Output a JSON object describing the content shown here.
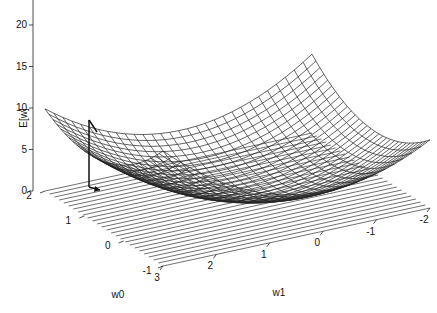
{
  "chart_data": {
    "type": "surface",
    "title": "",
    "xlabel": "w0",
    "ylabel": "w1",
    "zlabel": "E[w]",
    "x_range": [
      -1,
      2
    ],
    "y_range": [
      -2,
      3
    ],
    "z_range": [
      0,
      25
    ],
    "x_ticks": [
      "-1",
      "0",
      "1",
      "2"
    ],
    "y_ticks": [
      "-2",
      "-1",
      "0",
      "1",
      "2",
      "3"
    ],
    "z_ticks": [
      "0",
      "5",
      "10",
      "15",
      "20",
      "25"
    ],
    "grid_lines_floor": 25,
    "surface": {
      "description": "Quadratic error surface (paraboloid) E[w] over weights w0,w1, wireframe mesh",
      "mesh_resolution": [
        30,
        30
      ],
      "min_approx": {
        "w0": 0.6,
        "w1": 0.2,
        "E": 0.5
      },
      "corner_values": [
        {
          "w0": 2,
          "w1": 3,
          "E": 20
        },
        {
          "w0": 2,
          "w1": -2,
          "E": 22
        },
        {
          "w0": -1,
          "w1": -2,
          "E": 8
        },
        {
          "w0": -1,
          "w1": 3,
          "E": 15
        }
      ]
    },
    "annotations": [
      {
        "type": "arrow",
        "description": "negated gradient vector at a point on surface",
        "from_E": 15,
        "w0": 2,
        "w1": 3
      }
    ]
  }
}
